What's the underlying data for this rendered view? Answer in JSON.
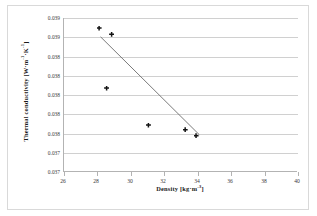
{
  "chart_data": {
    "type": "scatter",
    "title": "",
    "xlabel": "Density [kg·m⁻³]",
    "ylabel": "Thermal conductivity [W·m⁻¹·K⁻¹]",
    "xlim": [
      26,
      40
    ],
    "ylim": [
      0.0365,
      0.0385
    ],
    "xticks": [
      26,
      28,
      30,
      32,
      34,
      36,
      38,
      40
    ],
    "xtick_labels": [
      "26",
      "28",
      "30",
      "32",
      "34",
      "36",
      "38",
      "40"
    ],
    "yticks": [
      0.0385,
      0.038375,
      0.03825,
      0.038125,
      0.038,
      0.037875,
      0.03775,
      0.0376,
      0.0365
    ],
    "ytick_labels": [
      "0.039",
      "0.039",
      "0.038",
      "0.038",
      "0.038",
      "0.038",
      "0.038",
      "0.037",
      "0.037"
    ],
    "grid": true,
    "legend": false,
    "series": [
      {
        "name": "measurements",
        "marker": "diamond-cross",
        "color": "#141414",
        "points": [
          {
            "x": 28.1,
            "y": 0.03837
          },
          {
            "x": 28.85,
            "y": 0.03829
          },
          {
            "x": 28.55,
            "y": 0.03759
          },
          {
            "x": 31.05,
            "y": 0.03711
          },
          {
            "x": 33.25,
            "y": 0.03705
          },
          {
            "x": 33.9,
            "y": 0.03697
          }
        ]
      },
      {
        "name": "linear trendline",
        "type": "line",
        "color": "#6b6b6b",
        "from": {
          "x": 28.25,
          "y": 0.038255
        },
        "to": {
          "x": 34.15,
          "y": 0.036985
        }
      }
    ]
  },
  "axes": {
    "y_title": "Thermal conductivity [W·m",
    "y_title_sup1": "-1",
    "y_title_mid": "·K",
    "y_title_sup2": "-1",
    "y_title_end": "]",
    "x_title": "Density [kg·m",
    "x_title_sup": "-3",
    "x_title_end": "]"
  },
  "colors": {
    "marker": "#141414",
    "trendline": "#6b6b6b",
    "gridline": "#d0d0d0",
    "axis": "#b3b3b3",
    "frame": "#d9d9d9",
    "background": "#ffffff",
    "tick_text": "#3a3a3a",
    "title_text": "#1a1a1a"
  }
}
